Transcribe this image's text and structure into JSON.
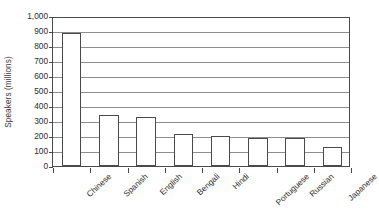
{
  "chart_data": {
    "type": "bar",
    "title": "",
    "xlabel": "",
    "ylabel": "Speakers (millions)",
    "categories": [
      "Chinese",
      "Spanish",
      "English",
      "Bengali",
      "Hindi",
      "Portuguese",
      "Russian",
      "Japanese"
    ],
    "values": [
      885,
      340,
      330,
      215,
      200,
      190,
      190,
      130
    ],
    "ylim": [
      0,
      1000
    ],
    "ytick_values": [
      0,
      100,
      200,
      300,
      400,
      500,
      600,
      700,
      800,
      900,
      1000
    ],
    "ytick_labels": [
      "0",
      "100",
      "200",
      "300",
      "400",
      "500",
      "600",
      "700",
      "800",
      "900",
      "1,000"
    ],
    "grid": true,
    "grid_axis": "y",
    "legend": false,
    "bar_fill_color": "#ffffff",
    "bar_edge_color": "#4a4a4a",
    "gridline_color": "#8d8d8d",
    "axis_color": "#4a4a4a",
    "background_color": "#ffffff"
  }
}
